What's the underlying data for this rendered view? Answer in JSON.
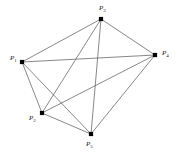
{
  "figure": {
    "background_color": "#ffffff",
    "edge_color": "#555555",
    "node_color": "#000000",
    "label_color": "#222222",
    "width": 179,
    "height": 167
  },
  "graph": {
    "type": "complete-graph",
    "vertex_count": 5,
    "edge_count": 10,
    "vertices": [
      {
        "id": "P1",
        "label": "P",
        "subscript": "1",
        "x": 22,
        "y": 62,
        "label_x": 10,
        "label_y": 55
      },
      {
        "id": "P2",
        "label": "P",
        "subscript": "2",
        "x": 42,
        "y": 113,
        "label_x": 29,
        "label_y": 115
      },
      {
        "id": "P3",
        "label": "P",
        "subscript": "3",
        "x": 101,
        "y": 19,
        "label_x": 99,
        "label_y": 5
      },
      {
        "id": "P4",
        "label": "P",
        "subscript": "4",
        "x": 155,
        "y": 55,
        "label_x": 162,
        "label_y": 50
      },
      {
        "id": "P5",
        "label": "P",
        "subscript": "5",
        "x": 91,
        "y": 134,
        "label_x": 86,
        "label_y": 141
      }
    ],
    "edges": [
      {
        "from": "P1",
        "to": "P2"
      },
      {
        "from": "P1",
        "to": "P3"
      },
      {
        "from": "P1",
        "to": "P4"
      },
      {
        "from": "P1",
        "to": "P5"
      },
      {
        "from": "P2",
        "to": "P3"
      },
      {
        "from": "P2",
        "to": "P4"
      },
      {
        "from": "P2",
        "to": "P5"
      },
      {
        "from": "P3",
        "to": "P4"
      },
      {
        "from": "P3",
        "to": "P5"
      },
      {
        "from": "P4",
        "to": "P5"
      }
    ]
  }
}
